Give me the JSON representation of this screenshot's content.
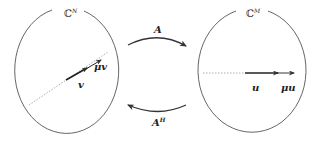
{
  "diagram": {
    "left_space": {
      "symbol": "ℂ",
      "superscript": "N",
      "vector_label": "v",
      "scaled_vector_label": "μv"
    },
    "right_space": {
      "symbol": "ℂ",
      "superscript": "M",
      "vector_label": "u",
      "scaled_vector_label": "μu"
    },
    "forward_map": {
      "label": "A",
      "direction": "left-to-right"
    },
    "adjoint_map": {
      "label": "A",
      "superscript": "H",
      "direction": "right-to-left"
    },
    "colors": {
      "stroke": "#333333",
      "dashed": "#999999",
      "background": "#ffffff"
    }
  }
}
